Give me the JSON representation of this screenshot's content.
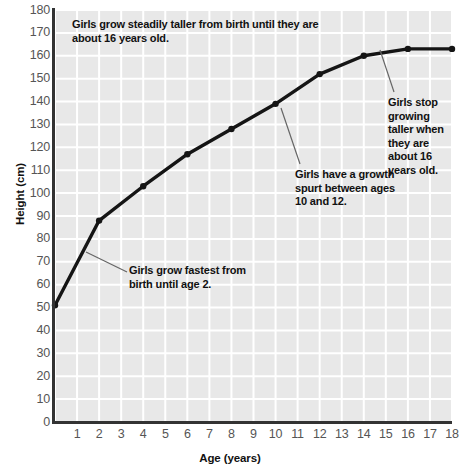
{
  "chart_data": {
    "type": "line",
    "title": "",
    "xlabel": "Age (years)",
    "ylabel": "Height (cm)",
    "xlim": [
      0,
      18
    ],
    "ylim": [
      0,
      180
    ],
    "grid": true,
    "legend": "none",
    "x_ticks": [
      "1",
      "2",
      "3",
      "4",
      "5",
      "6",
      "7",
      "8",
      "9",
      "10",
      "11",
      "12",
      "13",
      "14",
      "15",
      "16",
      "17",
      "18"
    ],
    "y_ticks": [
      "0",
      "10",
      "20",
      "30",
      "40",
      "50",
      "60",
      "70",
      "80",
      "90",
      "100",
      "110",
      "120",
      "130",
      "140",
      "150",
      "160",
      "170",
      "180"
    ],
    "series": [
      {
        "name": "Girls height",
        "x": [
          0,
          2,
          4,
          6,
          8,
          10,
          12,
          14,
          16,
          18
        ],
        "values": [
          51,
          88,
          103,
          117,
          128,
          139,
          152,
          160,
          163,
          163
        ]
      }
    ],
    "annotations": [
      {
        "id": "top-note",
        "text": "Girls grow steadily taller from birth until they are about 16 years old.",
        "leader": false
      },
      {
        "id": "birth-to-two-note",
        "text": "Girls grow fastest from birth until age 2.",
        "leader": true
      },
      {
        "id": "growth-spurt-note",
        "text": "Girls have a growth spurt between ages 10 and 12.",
        "leader": true
      },
      {
        "id": "stop-growing-note",
        "text": "Girls stop growing taller when they are about 16 years old.",
        "leader": true
      }
    ]
  },
  "colors": {
    "plot_background": "#e8e8e8",
    "gridline": "#ffffff",
    "series_line": "#151515",
    "axis": "#333333",
    "tick_label": "#555555",
    "annotation_text": "#111111",
    "leader_line": "#666666"
  }
}
